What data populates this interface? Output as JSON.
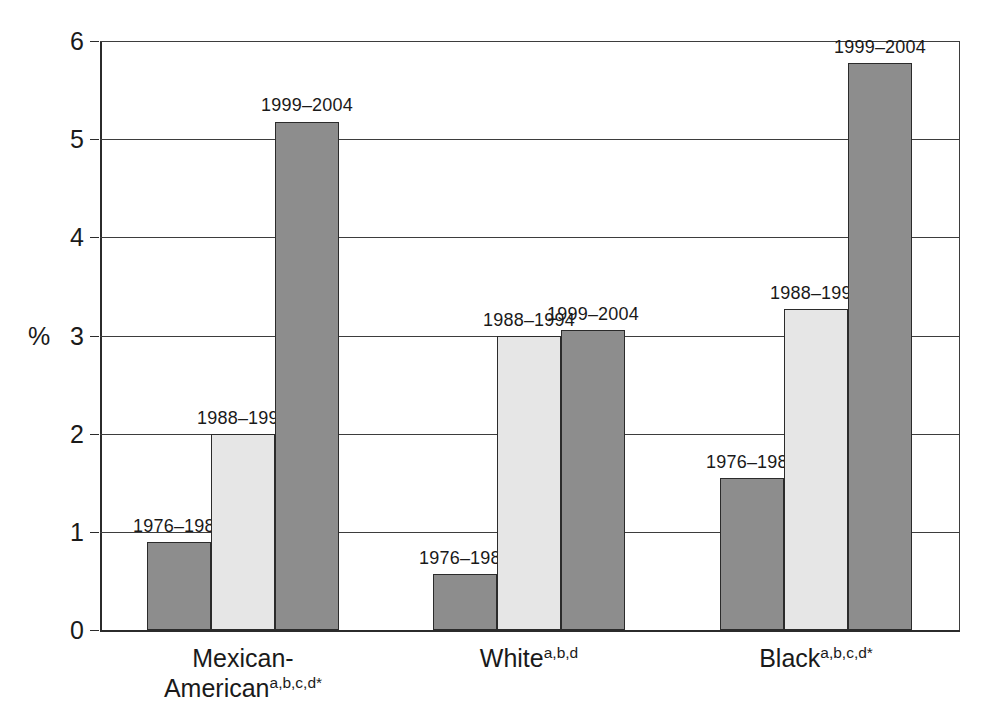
{
  "chart_data": {
    "type": "bar",
    "title": "",
    "subtitle": "",
    "xlabel": "",
    "ylabel": "%",
    "ylim": [
      0,
      6
    ],
    "ytick_values": [
      0,
      1,
      2,
      3,
      4,
      5,
      6
    ],
    "ytick_labels": [
      "0",
      "1",
      "2",
      "3",
      "4",
      "5",
      "6"
    ],
    "grid": true,
    "legend_position": "none",
    "categories": [
      "Mexican-American",
      "White",
      "Black"
    ],
    "category_superscripts": [
      "a,b,c,d*",
      "a,b,d",
      "a,b,c,d*"
    ],
    "series": [
      {
        "name": "1976–1980",
        "values": [
          0.9,
          0.57,
          1.55
        ],
        "color": "#8d8d8d"
      },
      {
        "name": "1988–1994",
        "values": [
          2.0,
          3.0,
          3.27
        ],
        "color": "#e6e6e6"
      },
      {
        "name": "1999–2004",
        "values": [
          5.18,
          3.06,
          5.78
        ],
        "color": "#8d8d8d"
      }
    ],
    "bar_value_labels": [
      [
        "1976–1980",
        "1988–1994",
        "1999–2004"
      ],
      [
        "1976–1980",
        "1988–1994",
        "1999–2004"
      ],
      [
        "1976–1980",
        "1988–1994",
        "1999–2004"
      ]
    ]
  },
  "axis": {
    "y_title": "%"
  },
  "ticks": {
    "t0": "0",
    "t1": "1",
    "t2": "2",
    "t3": "3",
    "t4": "4",
    "t5": "5",
    "t6": "6"
  },
  "groups": [
    {
      "name": "Mexican-American",
      "sup": "a,b,c,d*",
      "bars": [
        {
          "label": "1976–1980",
          "value": 0.9
        },
        {
          "label": "1988–1994",
          "value": 2.0
        },
        {
          "label": "1999–2004",
          "value": 5.18
        }
      ]
    },
    {
      "name": "White",
      "sup": "a,b,d",
      "bars": [
        {
          "label": "1976–1980",
          "value": 0.57
        },
        {
          "label": "1988–1994",
          "value": 3.0
        },
        {
          "label": "1999–2004",
          "value": 3.06
        }
      ]
    },
    {
      "name": "Black",
      "sup": "a,b,c,d*",
      "bars": [
        {
          "label": "1976–1980",
          "value": 1.55
        },
        {
          "label": "1988–1994",
          "value": 3.27
        },
        {
          "label": "1999–2004",
          "value": 5.78
        }
      ]
    }
  ],
  "colors": {
    "bar_dark": "#8d8d8d",
    "bar_light": "#e6e6e6",
    "axis": "#2b2b2b",
    "grid": "#3d3d3d",
    "background": "#ffffff"
  }
}
